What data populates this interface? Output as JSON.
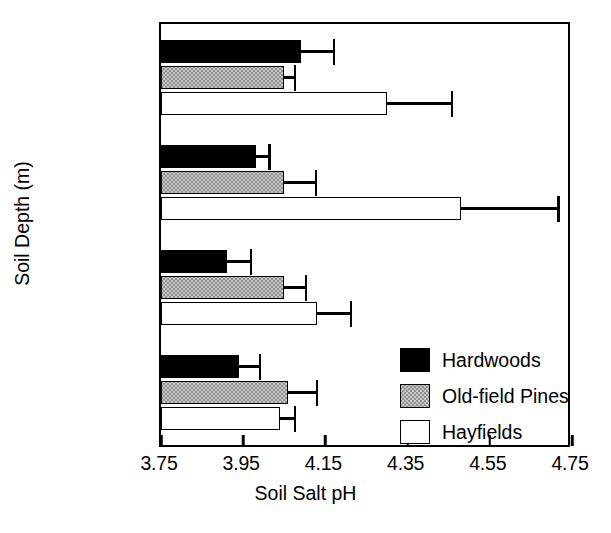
{
  "chart_data": {
    "type": "bar",
    "orientation": "horizontal",
    "title": "",
    "xlabel": "Soil Salt pH",
    "ylabel": "Soil Depth (m)",
    "xlim": [
      3.75,
      4.75
    ],
    "xticks": [
      "3.75",
      "3.95",
      "4.15",
      "4.35",
      "4.55",
      "4.75"
    ],
    "xtick_values": [
      3.75,
      3.95,
      4.15,
      4.35,
      4.55,
      4.75
    ],
    "grid": false,
    "legend_position": "lower-right-inside",
    "categories": [
      "0-0.3",
      "0.3-0.55",
      "0.55-0.875",
      "0.875-1.1"
    ],
    "series": [
      {
        "name": "Hardwoods",
        "color": "#000000",
        "fill": "solid-black",
        "values": [
          4.09,
          3.98,
          3.91,
          3.94
        ],
        "errors": [
          0.08,
          0.034,
          0.059,
          0.051
        ]
      },
      {
        "name": "Old-field Pines",
        "color": "#c8c8c8",
        "fill": "stippled-gray",
        "values": [
          4.05,
          4.05,
          4.05,
          4.06
        ],
        "errors": [
          0.027,
          0.078,
          0.053,
          0.069
        ]
      },
      {
        "name": "Hayfields",
        "color": "#ffffff",
        "fill": "open-white",
        "values": [
          4.3,
          4.48,
          4.13,
          4.04
        ],
        "errors": [
          0.158,
          0.237,
          0.083,
          0.036
        ]
      }
    ]
  },
  "axis": {
    "x_title": "Soil Salt pH",
    "y_title": "Soil Depth (m)",
    "x_tick_labels": [
      "3.75",
      "3.95",
      "4.15",
      "4.35",
      "4.55",
      "4.75"
    ],
    "y_group_labels": [
      "0-0.3",
      "0.3-0.55",
      "0.55-0.875",
      "0.875-1.1"
    ]
  },
  "legend": {
    "entries": [
      {
        "label": "Hardwoods",
        "swatch": "solid-black-swatch"
      },
      {
        "label": "Old-field Pines",
        "swatch": "stippled-gray-swatch"
      },
      {
        "label": "Hayfields",
        "swatch": "open-white-swatch"
      }
    ]
  }
}
